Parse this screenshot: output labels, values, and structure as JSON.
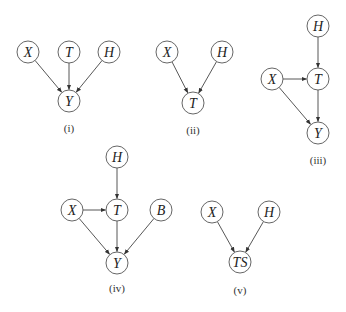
{
  "figure": {
    "node_radius": 11,
    "stroke_color": "#555555",
    "panels": [
      {
        "id": "i",
        "caption": "(i)",
        "caption_pos": [
          69,
          128
        ],
        "nodes": [
          {
            "id": "X",
            "label": "X",
            "x": 28,
            "y": 52
          },
          {
            "id": "T",
            "label": "T",
            "x": 69,
            "y": 52
          },
          {
            "id": "H",
            "label": "H",
            "x": 109,
            "y": 52
          },
          {
            "id": "Y",
            "label": "Y",
            "x": 69,
            "y": 101
          }
        ],
        "edges": [
          [
            "X",
            "Y"
          ],
          [
            "T",
            "Y"
          ],
          [
            "H",
            "Y"
          ]
        ]
      },
      {
        "id": "ii",
        "caption": "(ii)",
        "caption_pos": [
          193,
          130
        ],
        "nodes": [
          {
            "id": "X",
            "label": "X",
            "x": 167,
            "y": 52
          },
          {
            "id": "H",
            "label": "H",
            "x": 222,
            "y": 52
          },
          {
            "id": "T",
            "label": "T",
            "x": 193,
            "y": 103
          }
        ],
        "edges": [
          [
            "X",
            "T"
          ],
          [
            "H",
            "T"
          ]
        ]
      },
      {
        "id": "iii",
        "caption": "(iii)",
        "caption_pos": [
          318,
          160
        ],
        "nodes": [
          {
            "id": "H",
            "label": "H",
            "x": 318,
            "y": 26
          },
          {
            "id": "X",
            "label": "X",
            "x": 272,
            "y": 79
          },
          {
            "id": "T",
            "label": "T",
            "x": 318,
            "y": 79
          },
          {
            "id": "Y",
            "label": "Y",
            "x": 318,
            "y": 133
          }
        ],
        "edges": [
          [
            "H",
            "T"
          ],
          [
            "X",
            "T"
          ],
          [
            "X",
            "Y"
          ],
          [
            "T",
            "Y"
          ]
        ]
      },
      {
        "id": "iv",
        "caption": "(iv)",
        "caption_pos": [
          117,
          288
        ],
        "nodes": [
          {
            "id": "H",
            "label": "H",
            "x": 117,
            "y": 157
          },
          {
            "id": "X",
            "label": "X",
            "x": 72,
            "y": 210
          },
          {
            "id": "T",
            "label": "T",
            "x": 117,
            "y": 210
          },
          {
            "id": "B",
            "label": "B",
            "x": 161,
            "y": 210
          },
          {
            "id": "Y",
            "label": "Y",
            "x": 117,
            "y": 263
          }
        ],
        "edges": [
          [
            "H",
            "T"
          ],
          [
            "X",
            "T"
          ],
          [
            "X",
            "Y"
          ],
          [
            "T",
            "Y"
          ],
          [
            "B",
            "Y"
          ]
        ]
      },
      {
        "id": "v",
        "caption": "(v)",
        "caption_pos": [
          240,
          290
        ],
        "nodes": [
          {
            "id": "X",
            "label": "X",
            "x": 212,
            "y": 212
          },
          {
            "id": "H",
            "label": "H",
            "x": 269,
            "y": 212
          },
          {
            "id": "TS",
            "label": "TS",
            "x": 240,
            "y": 262
          }
        ],
        "edges": [
          [
            "X",
            "TS"
          ],
          [
            "H",
            "TS"
          ]
        ]
      }
    ]
  }
}
